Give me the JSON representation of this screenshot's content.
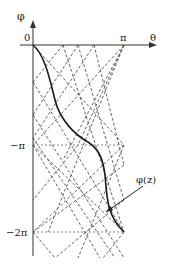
{
  "figure": {
    "axes": {
      "vertical_label": "φ",
      "horizontal_label": "θ",
      "origin_label": "0",
      "theta_tick_label": "π",
      "phi_tick_labels": [
        "−π",
        "−2π"
      ]
    },
    "curve_label": "φ(z)",
    "colors": {
      "axis": "#333333",
      "curve": "#1a1a1a",
      "dashed": "#555555",
      "text": "#222222"
    },
    "geometry": {
      "origin": [
        33,
        45
      ],
      "theta_pi_x": 124,
      "phi_minus_pi_y": 145,
      "phi_minus_2pi_y": 232,
      "axis_x_end": 157,
      "axis_y_top": 20,
      "axis_y_bottom": 256
    },
    "dashed_lines": [
      [
        [
          33,
          45
        ],
        [
          124,
          145
        ]
      ],
      [
        [
          124,
          45
        ],
        [
          33,
          145
        ]
      ],
      [
        [
          63,
          45
        ],
        [
          33,
          82
        ]
      ],
      [
        [
          78,
          45
        ],
        [
          33,
          115
        ]
      ],
      [
        [
          94,
          45
        ],
        [
          33,
          138
        ]
      ],
      [
        [
          63,
          45
        ],
        [
          124,
          232
        ]
      ],
      [
        [
          78,
          45
        ],
        [
          124,
          200
        ]
      ],
      [
        [
          94,
          45
        ],
        [
          124,
          165
        ]
      ],
      [
        [
          124,
          45
        ],
        [
          78,
          145
        ]
      ],
      [
        [
          124,
          45
        ],
        [
          63,
          160
        ]
      ],
      [
        [
          124,
          45
        ],
        [
          48,
          232
        ]
      ],
      [
        [
          33,
          82
        ],
        [
          124,
          232
        ]
      ],
      [
        [
          33,
          115
        ],
        [
          124,
          258
        ]
      ],
      [
        [
          33,
          138
        ],
        [
          115,
          258
        ]
      ],
      [
        [
          124,
          145
        ],
        [
          33,
          232
        ]
      ],
      [
        [
          124,
          145
        ],
        [
          78,
          258
        ]
      ],
      [
        [
          124,
          165
        ],
        [
          33,
          232
        ]
      ],
      [
        [
          124,
          200
        ],
        [
          55,
          258
        ]
      ],
      [
        [
          33,
          145
        ],
        [
          124,
          232
        ]
      ],
      [
        [
          33,
          145
        ],
        [
          100,
          258
        ]
      ],
      [
        [
          78,
          145
        ],
        [
          33,
          200
        ]
      ],
      [
        [
          124,
          232
        ],
        [
          103,
          258
        ]
      ],
      [
        [
          33,
          232
        ],
        [
          55,
          258
        ]
      ]
    ],
    "horizontal_dashed": [
      [
        [
          33,
          145
        ],
        [
          124,
          145
        ]
      ],
      [
        [
          33,
          232
        ],
        [
          124,
          232
        ]
      ]
    ],
    "curve_path": "M33,45 C45,55 50,80 55,100 C60,120 75,135 88,142 C100,150 103,160 105,175 C107,195 106,215 124,232",
    "annotation_arrow": {
      "from": [
        143,
        186
      ],
      "to": [
        106,
        212
      ]
    }
  }
}
